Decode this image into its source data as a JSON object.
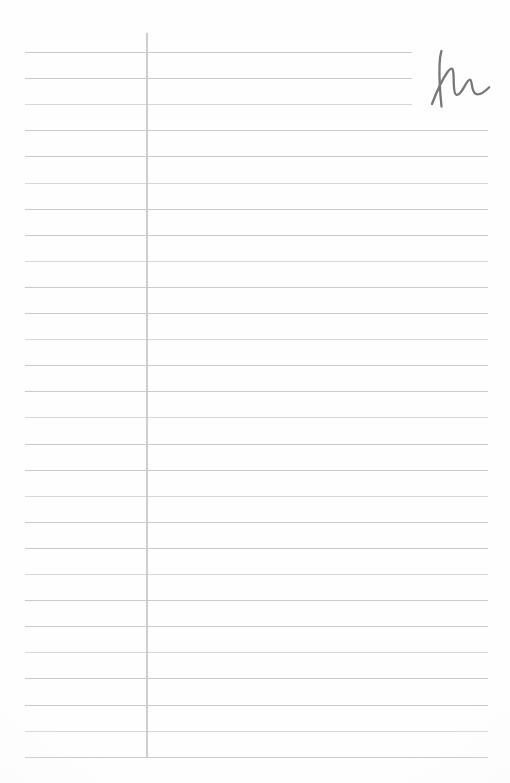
{
  "document": {
    "kind": "lined-notebook-page",
    "description": "Blank ruled ledger / notebook page with a vertical margin rule and a single handwritten cursive mark in the upper right",
    "page_width": 510,
    "page_height": 783,
    "background_color": "#fefefe",
    "rule_color": "#c6c7c9",
    "margin_rule_color": "#c9cacc",
    "ink_color": "#77777a"
  },
  "ruling": {
    "line_count": 28,
    "first_line_y": 52,
    "line_spacing": 26.1,
    "line_left_x": 25,
    "line_right_x": 488,
    "short_line_right_x": 412,
    "short_line_indices": [
      0,
      1,
      2
    ],
    "thickness_px": 1.4
  },
  "margin_rule": {
    "x": 146,
    "top_y": 33,
    "bottom_y": 758,
    "thickness_px": 2.6
  },
  "handwriting": {
    "glyph": "M",
    "style": "cursive",
    "x": 420,
    "y": 48,
    "width": 72,
    "height": 62,
    "stroke_width": 2.3,
    "label": "handwritten-m-mark"
  },
  "content": {
    "written_text": "",
    "note": "No printed or typed text appears on the page"
  }
}
